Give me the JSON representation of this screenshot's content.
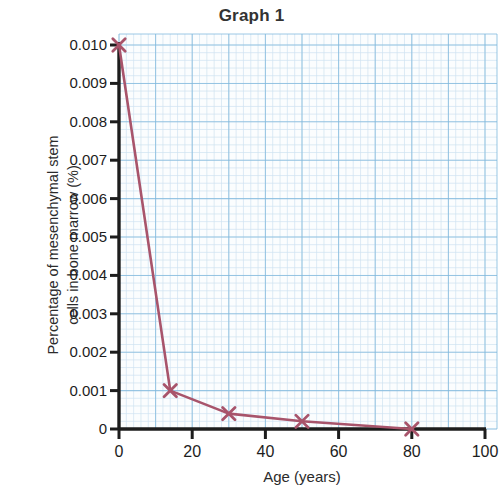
{
  "chart_data": {
    "type": "line",
    "title": "Graph 1",
    "xlabel": "Age (years)",
    "ylabel": "Percentage of mesenchymal stem cells in bone marrow (%)",
    "ylabel_line1": "Percentage of mesenchymal stem",
    "ylabel_line2": "cells in bone marrow (%)",
    "xlim": [
      0,
      100
    ],
    "ylim": [
      0,
      0.01
    ],
    "xticks": [
      0,
      20,
      40,
      60,
      80,
      100
    ],
    "xtick_labels": [
      "0",
      "20",
      "40",
      "60",
      "80",
      "100"
    ],
    "yticks": [
      0,
      0.001,
      0.002,
      0.003,
      0.004,
      0.005,
      0.006,
      0.007,
      0.008,
      0.009,
      0.01
    ],
    "ytick_labels": [
      "0",
      "0.001",
      "0.002",
      "0.003",
      "0.004",
      "0.005",
      "0.006",
      "0.007",
      "0.008",
      "0.009",
      "0.010"
    ],
    "grid": true,
    "grid_minor_step_x": 2,
    "grid_minor_step_y": 0.0002,
    "grid_major_step_x": 10,
    "grid_major_step_y": 0.001,
    "legend": null,
    "series": [
      {
        "name": "Mesenchymal stem cells",
        "marker": "x",
        "color": "#A8546B",
        "x": [
          0,
          14,
          30,
          50,
          80
        ],
        "y": [
          0.01,
          0.001,
          0.0004,
          0.0002,
          0.0
        ]
      }
    ],
    "colors": {
      "line": "#A8546B",
      "marker": "#A8546B",
      "axis": "#1d1d1d",
      "grid_minor": "#cfe3f0",
      "grid_major": "#7fb8dd",
      "paper": "#fbfdfe",
      "text": "#2b2b2b"
    }
  }
}
